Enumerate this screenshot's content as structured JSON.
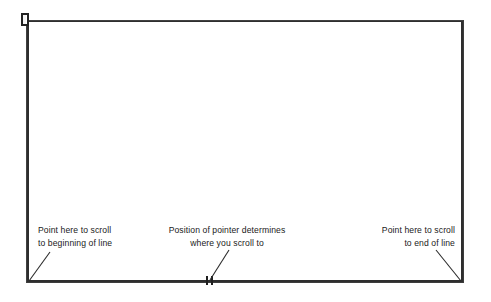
{
  "figure": {
    "type": "scroll-bar-illustration",
    "background_color": "#ffffff",
    "line_color": "#2e2e2e",
    "text_color": "#1a1a1a"
  },
  "window_frame": {
    "label": "scroll area frame",
    "x": 26,
    "y": 20,
    "width": 438,
    "height": 263
  },
  "scroll_thumb": {
    "label": "scroll thumb marker",
    "x": 21,
    "y": 13
  },
  "pointer_tick": {
    "label": "pointer position tick",
    "x": 206,
    "y": 276
  },
  "callouts": [
    {
      "id": "scroll-to-beginning",
      "line1": "Point here to scroll",
      "line2": "to beginning of line",
      "align": "left"
    },
    {
      "id": "pointer-position",
      "line1": "Position of pointer determines",
      "line2": "where you scroll to",
      "align": "center"
    },
    {
      "id": "scroll-to-end",
      "line1": "Point here to scroll",
      "line2": "to end of line",
      "align": "right"
    }
  ],
  "leader_lines": [
    {
      "id": "leader-begin",
      "x1": 50,
      "y1": 252,
      "x2": 29,
      "y2": 281
    },
    {
      "id": "leader-pointer",
      "x1": 229,
      "y1": 250,
      "x2": 210,
      "y2": 280
    },
    {
      "id": "leader-end",
      "x1": 436,
      "y1": 250,
      "x2": 461,
      "y2": 281
    }
  ]
}
